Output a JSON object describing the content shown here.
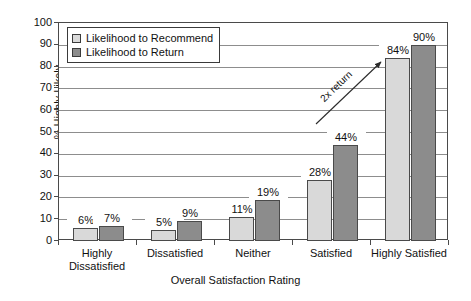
{
  "chart_data": {
    "type": "bar",
    "title": "",
    "xlabel": "Overall Satisfaction Rating",
    "ylabel": "% Highly Likely",
    "ylim": [
      0,
      100
    ],
    "ytick_step": 10,
    "yticks": [
      0,
      10,
      20,
      30,
      40,
      50,
      60,
      70,
      80,
      90,
      100
    ],
    "ytick_labels": [
      "0",
      "10",
      "20",
      "30",
      "40",
      "50",
      "60",
      "70",
      "80",
      "90",
      "100"
    ],
    "grid": true,
    "legend_position": "upper-left",
    "categories": [
      "Highly\nDissatisfied",
      "Dissatisfied",
      "Neither",
      "Satisfied",
      "Highly Satisfied"
    ],
    "series": [
      {
        "name": "Likelihood to Recommend",
        "color": "#d9d9d9",
        "values": [
          6,
          5,
          11,
          28,
          84
        ],
        "data_labels": [
          "6%",
          "5%",
          "11%",
          "28%",
          "84%"
        ]
      },
      {
        "name": "Likelihood to Return",
        "color": "#8c8c8c",
        "values": [
          7,
          9,
          19,
          44,
          90
        ],
        "data_labels": [
          "7%",
          "9%",
          "19%",
          "44%",
          "90%"
        ]
      }
    ],
    "annotations": [
      {
        "text": "2x return",
        "type": "arrow",
        "direction": "up-right"
      }
    ]
  },
  "colors": {
    "series_light": "#d9d9d9",
    "series_dark": "#8c8c8c",
    "axis": "#4a4a4a",
    "grid": "#8d8d8d",
    "background": "#ffffff"
  }
}
